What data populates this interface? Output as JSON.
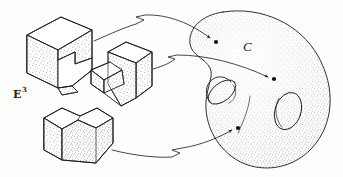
{
  "figure": {
    "background_color": "#fdfdfb",
    "ink_color": "#1a1a1a",
    "width": 343,
    "height": 177,
    "labels": {
      "domain_label": "E",
      "domain_superscript": "3",
      "codomain_label": "C"
    },
    "domain": {
      "name": "E-cubed",
      "description": "Euclidean three-space containing three stippled polyhedral solids",
      "objects": [
        {
          "id": "block-upper-left",
          "name": "notched-cube-upper-left",
          "cx": 58,
          "cy": 45,
          "shading": "stipple"
        },
        {
          "id": "block-middle",
          "name": "notched-cube-middle",
          "cx": 124,
          "cy": 72,
          "shading": "stipple"
        },
        {
          "id": "block-lower-left",
          "name": "notched-cube-lower-left",
          "cx": 70,
          "cy": 137,
          "shading": "stipple"
        }
      ]
    },
    "codomain": {
      "name": "configuration-surface",
      "label": "C",
      "genus": 2,
      "shading": "stipple",
      "marked_points": [
        {
          "id": "point-1",
          "x": 216,
          "y": 42
        },
        {
          "id": "point-2",
          "x": 274,
          "y": 79
        },
        {
          "id": "point-3",
          "x": 238,
          "y": 128
        }
      ]
    },
    "arrows": [
      {
        "id": "arrow-1",
        "name": "map-arrow-upper",
        "from_object": "block-upper-left",
        "to_point": "point-1",
        "style": "squiggle-break"
      },
      {
        "id": "arrow-2",
        "name": "map-arrow-middle",
        "from_object": "block-middle",
        "to_point": "point-2",
        "style": "squiggle-break"
      },
      {
        "id": "arrow-3",
        "name": "map-arrow-lower",
        "from_object": "block-lower-left",
        "to_point": "point-3",
        "style": "squiggle-break"
      }
    ]
  }
}
